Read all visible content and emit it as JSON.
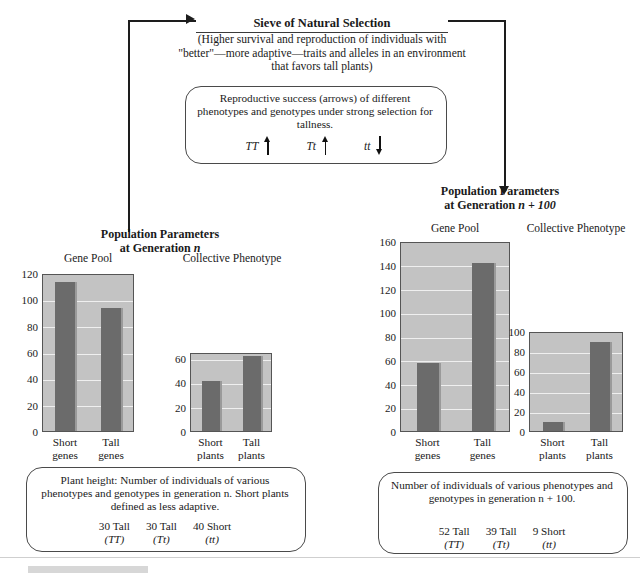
{
  "sieve": {
    "title": "Sieve of Natural Selection",
    "body": "(Higher survival and reproduction of individuals with \"better\"—more adaptive—traits and alleles in an environment that favors tall plants)",
    "inner_box_text": "Reproductive success (arrows) of different phenotypes and genotypes under strong selection for tallness.",
    "genotypes": [
      {
        "label": "TT",
        "direction": "up",
        "icon": "arrow-up-icon"
      },
      {
        "label": "Tt",
        "direction": "up",
        "icon": "arrow-up-icon"
      },
      {
        "label": "tt",
        "direction": "down",
        "icon": "arrow-down-icon"
      }
    ]
  },
  "left_panel": {
    "title_line1": "Population Parameters",
    "title_line2_prefix": "at Generation ",
    "title_line2_italic": "n",
    "caption_text": "Plant height: Number of individuals of various phenotypes and genotypes in generation n. Short plants defined as less adaptive.",
    "counts": [
      {
        "value": "30 Tall",
        "genotype": "(TT)"
      },
      {
        "value": "30 Tall",
        "genotype": "(Tt)"
      },
      {
        "value": "40 Short",
        "genotype": "(tt)"
      }
    ]
  },
  "right_panel": {
    "title_line1": "Population Parameters",
    "title_line2_prefix": "at Generation ",
    "title_line2_italic": "n + 100",
    "caption_text": "Number of individuals of various phenotypes and genotypes in generation n + 100.",
    "counts": [
      {
        "value": "52 Tall",
        "genotype": "(TT)"
      },
      {
        "value": "39 Tall",
        "genotype": "(Tt)"
      },
      {
        "value": "9 Short",
        "genotype": "(tt)"
      }
    ]
  },
  "colors": {
    "bar": "#6b6b6b",
    "plot_background": "#c3c3c3",
    "gridline": "#efefef",
    "axis": "#555555",
    "line": "#1d1d1d"
  },
  "chart_data": [
    {
      "id": "gen-n-gene-pool",
      "type": "bar",
      "title": "Gene Pool",
      "categories": [
        "Short genes",
        "Tall genes"
      ],
      "category_lines": [
        [
          "Short",
          "genes"
        ],
        [
          "Tall",
          "genes"
        ]
      ],
      "values": [
        115,
        95
      ],
      "ylim": [
        0,
        120
      ],
      "yticks": [
        0,
        20,
        40,
        60,
        80,
        100,
        120
      ],
      "xlabel": "",
      "ylabel": "",
      "grid": true
    },
    {
      "id": "gen-n-collective-phenotype",
      "type": "bar",
      "title": "Collective Phenotype",
      "categories": [
        "Short plants",
        "Tall plants"
      ],
      "category_lines": [
        [
          "Short",
          "plants"
        ],
        [
          "Tall",
          "plants"
        ]
      ],
      "values": [
        42,
        63
      ],
      "ylim": [
        0,
        65
      ],
      "yticks": [
        0,
        20,
        40,
        60
      ],
      "xlabel": "",
      "ylabel": "",
      "grid": true
    },
    {
      "id": "gen-n100-gene-pool",
      "type": "bar",
      "title": "Gene Pool",
      "categories": [
        "Short genes",
        "Tall genes"
      ],
      "category_lines": [
        [
          "Short",
          "genes"
        ],
        [
          "Tall",
          "genes"
        ]
      ],
      "values": [
        58,
        143
      ],
      "ylim": [
        0,
        160
      ],
      "yticks": [
        0,
        20,
        40,
        60,
        80,
        100,
        120,
        140,
        160
      ],
      "xlabel": "",
      "ylabel": "",
      "grid": true
    },
    {
      "id": "gen-n100-collective-phenotype",
      "type": "bar",
      "title": "Collective Phenotype",
      "categories": [
        "Short plants",
        "Tall plants"
      ],
      "category_lines": [
        [
          "Short",
          "plants"
        ],
        [
          "Tall",
          "plants"
        ]
      ],
      "values": [
        9,
        91
      ],
      "ylim": [
        0,
        100
      ],
      "yticks": [
        0,
        20,
        40,
        60,
        80,
        100
      ],
      "xlabel": "",
      "ylabel": "",
      "grid": true
    }
  ]
}
